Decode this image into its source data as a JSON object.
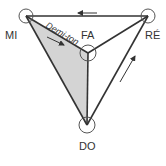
{
  "diagram": {
    "type": "tetrahedron-note-graph",
    "nodes": [
      {
        "id": "MI",
        "label": "MI",
        "x": 26,
        "y": 16
      },
      {
        "id": "RE",
        "label": "RÉ",
        "x": 148,
        "y": 16
      },
      {
        "id": "FA",
        "label": "FA",
        "x": 88,
        "y": 53
      },
      {
        "id": "DO",
        "label": "DO",
        "x": 87,
        "y": 125
      }
    ],
    "edges": [
      {
        "from": "MI",
        "to": "RE"
      },
      {
        "from": "MI",
        "to": "FA"
      },
      {
        "from": "MI",
        "to": "DO"
      },
      {
        "from": "FA",
        "to": "RE"
      },
      {
        "from": "FA",
        "to": "DO"
      },
      {
        "from": "DO",
        "to": "RE"
      }
    ],
    "shaded_face": [
      "MI",
      "FA",
      "DO"
    ],
    "edge_annotation": {
      "edge": "MI-FA",
      "text": "Demi-ton"
    },
    "arrows": [
      {
        "edge": "RE-MI",
        "direction": "toward MI"
      },
      {
        "edge": "MI-FA",
        "direction": "toward FA"
      },
      {
        "edge": "DO-RE",
        "direction": "toward RE"
      }
    ],
    "colors": {
      "line": "#333333",
      "shade": "#d4d4d4",
      "node_stroke": "#555555",
      "text": "#333333"
    }
  }
}
